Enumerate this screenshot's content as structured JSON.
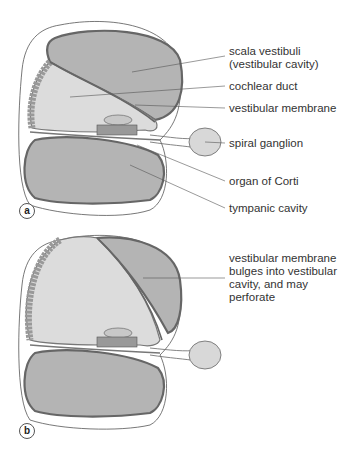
{
  "colors": {
    "outline": "#555555",
    "scala_fill": "#b4b4b4",
    "duct_fill": "#dcdcdc",
    "ganglion_fill": "#d8d8d8",
    "text": "#333333"
  },
  "panels": [
    {
      "id": "a",
      "badge": "a",
      "labels": [
        {
          "text_lines": [
            "scala vestibuli",
            "(vestibular cavity)"
          ]
        },
        {
          "text_lines": [
            "cochlear duct"
          ]
        },
        {
          "text_lines": [
            "vestibular membrane"
          ]
        },
        {
          "text_lines": [
            "spiral ganglion"
          ]
        },
        {
          "text_lines": [
            "organ of Corti"
          ]
        },
        {
          "text_lines": [
            "tympanic cavity"
          ]
        }
      ]
    },
    {
      "id": "b",
      "badge": "b",
      "labels": [
        {
          "text_lines": [
            "vestibular membrane",
            "bulges into vestibular",
            "cavity, and may",
            "perforate"
          ]
        }
      ]
    }
  ]
}
